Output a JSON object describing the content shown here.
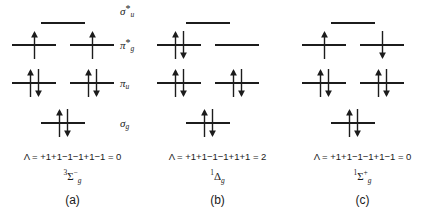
{
  "figure": {
    "orbital_labels": [
      {
        "key": "sigma_u_star",
        "symbol": "σ",
        "star": "*",
        "sub": "u"
      },
      {
        "key": "pi_g_star",
        "symbol": "π",
        "star": "*",
        "sub": "g"
      },
      {
        "key": "pi_u",
        "symbol": "π",
        "star": "",
        "sub": "u"
      },
      {
        "key": "sigma_g",
        "symbol": "σ",
        "star": "",
        "sub": "g"
      }
    ],
    "panels": [
      {
        "id": "a",
        "caption": "(a)",
        "lambda": "Λ = +1+1−1−1+1−1 = 0",
        "term": {
          "multiplicity": "3",
          "letter": "Σ",
          "parity": "g",
          "superscript": "−"
        },
        "levels": {
          "sigma_u_star": {
            "center": "empty"
          },
          "pi_g_star": {
            "left": "up",
            "right": "up"
          },
          "pi_u": {
            "left": "updown",
            "right": "updown"
          },
          "sigma_g": {
            "center": "updown"
          }
        }
      },
      {
        "id": "b",
        "caption": "(b)",
        "lambda": "Λ = +1+1−1−1+1+1 = 2",
        "term": {
          "multiplicity": "1",
          "letter": "Δ",
          "parity": "g",
          "superscript": ""
        },
        "levels": {
          "sigma_u_star": {
            "center": "empty"
          },
          "pi_g_star": {
            "left": "updown",
            "right": "empty"
          },
          "pi_u": {
            "left": "updown",
            "right": "updown"
          },
          "sigma_g": {
            "center": "updown"
          }
        }
      },
      {
        "id": "c",
        "caption": "(c)",
        "lambda": "Λ = +1+1−1−1+1−1 = 0",
        "term": {
          "multiplicity": "1",
          "letter": "Σ",
          "parity": "g",
          "superscript": "+"
        },
        "levels": {
          "sigma_u_star": {
            "center": "empty"
          },
          "pi_g_star": {
            "left": "up",
            "right": "down"
          },
          "pi_u": {
            "left": "updown",
            "right": "updown"
          },
          "sigma_g": {
            "center": "updown"
          }
        }
      }
    ]
  }
}
